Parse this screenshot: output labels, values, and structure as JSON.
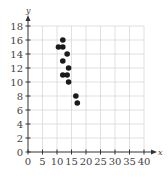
{
  "chart_data": {
    "type": "scatter",
    "title": "",
    "xlabel": "x",
    "ylabel": "y",
    "xlim": [
      0,
      40
    ],
    "ylim": [
      0,
      18
    ],
    "xticks": [
      0,
      5,
      10,
      15,
      20,
      25,
      30,
      35,
      40
    ],
    "yticks": [
      0,
      2,
      4,
      6,
      8,
      10,
      12,
      14,
      16,
      18
    ],
    "grid": true,
    "legend": null,
    "points": [
      {
        "x": 12,
        "y": 16
      },
      {
        "x": 10.5,
        "y": 15
      },
      {
        "x": 12,
        "y": 15
      },
      {
        "x": 13.5,
        "y": 14
      },
      {
        "x": 12,
        "y": 13
      },
      {
        "x": 14,
        "y": 12
      },
      {
        "x": 12,
        "y": 11
      },
      {
        "x": 13.5,
        "y": 11
      },
      {
        "x": 14,
        "y": 10
      },
      {
        "x": 16.5,
        "y": 8
      },
      {
        "x": 17,
        "y": 7
      }
    ],
    "point_color": "#1a1a1a"
  },
  "axes": {
    "x_label": "x",
    "y_label": "y"
  }
}
